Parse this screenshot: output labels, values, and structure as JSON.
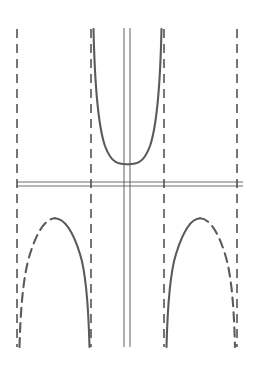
{
  "figure": {
    "title": "",
    "background_color": "#ffffff",
    "width": 259,
    "height": 375,
    "curve_color": "#5a5a5a",
    "asymptote_color": "#4a4a4a",
    "axis_color": "#6e6e6e",
    "curve_stroke_width": 2.1,
    "asymptote_stroke_width": 1.5,
    "axis_stroke_width": 1.1,
    "dash_pattern": "9 6"
  },
  "chart_data": {
    "type": "line",
    "title": "",
    "xlabel": "",
    "ylabel": "",
    "grid": false,
    "legend": false,
    "legend_position": "none",
    "axes": {
      "origin_px": {
        "x": 127,
        "y": 186
      },
      "x_axis": {
        "y_px": 186,
        "x_start_px": 17,
        "x_end_px": 243,
        "double_rule": true,
        "rule_offsets_px": [
          -4,
          0
        ]
      },
      "y_axis": {
        "x_px": 127,
        "y_start_px": 28,
        "y_end_px": 347,
        "double_rule": true,
        "rule_offsets_px": [
          -3,
          3
        ]
      },
      "xlim_px": [
        17,
        243
      ],
      "ylim_px": [
        28,
        347
      ]
    },
    "asymptotes": [
      {
        "name": "asymptote-1",
        "x_px": 17,
        "style": "dashed",
        "y_top_px": 29,
        "y_bottom_px": 347
      },
      {
        "name": "asymptote-2",
        "x_px": 91,
        "style": "dashed",
        "y_top_px": 29,
        "y_bottom_px": 347
      },
      {
        "name": "asymptote-3",
        "x_px": 164,
        "style": "dashed",
        "y_top_px": 29,
        "y_bottom_px": 347
      },
      {
        "name": "asymptote-4",
        "x_px": 237,
        "style": "dashed",
        "y_top_px": 29,
        "y_bottom_px": 347
      }
    ],
    "series": [
      {
        "name": "upper-branch",
        "style": "solid",
        "quadrant": "above-x-axis",
        "vertex_px": {
          "x": 127,
          "y": 164
        },
        "left_asymptote_px": 93,
        "right_asymptote_px": 161,
        "top_px": 29,
        "path": "M 93.5 29 C 94.6 78 97.5 124 105 146 C 112 165 120 164.2 127.5 164.2 C 135 164.2 143 165 150 146 C 157.5 124 160.4 78 161.5 29"
      },
      {
        "name": "lower-left-branch-dashed-half",
        "style": "dashed",
        "quadrant": "below-x-axis-left",
        "vertex_px": {
          "x": 55,
          "y": 218
        },
        "asymptote_px": 19,
        "bottom_px": 347,
        "path": "M 19.5 347 C 20.4 312 23 276 30 254 C 37.5 230 46 218.6 55 218.3"
      },
      {
        "name": "lower-left-branch-solid-half",
        "style": "solid",
        "quadrant": "below-x-axis-left",
        "vertex_px": {
          "x": 55,
          "y": 218
        },
        "asymptote_px": 89,
        "bottom_px": 347,
        "path": "M 55 218.3 C 64 218.6 72.5 230 80 254 C 87 276 88.6 312 89.5 347"
      },
      {
        "name": "lower-right-branch-solid-half",
        "style": "solid",
        "quadrant": "below-x-axis-right",
        "vertex_px": {
          "x": 200,
          "y": 218
        },
        "asymptote_px": 166,
        "bottom_px": 347,
        "path": "M 166.5 347 C 167.4 312 169 276 176 254 C 183.5 230 191 218.6 200 218.3"
      },
      {
        "name": "lower-right-branch-dashed-half",
        "style": "dashed",
        "quadrant": "below-x-axis-right",
        "vertex_px": {
          "x": 200,
          "y": 218
        },
        "asymptote_px": 235,
        "bottom_px": 347,
        "path": "M 200 218.3 C 209 218.6 217.5 230 225 254 C 232 276 234.1 312 235 347"
      }
    ],
    "annotations": []
  }
}
